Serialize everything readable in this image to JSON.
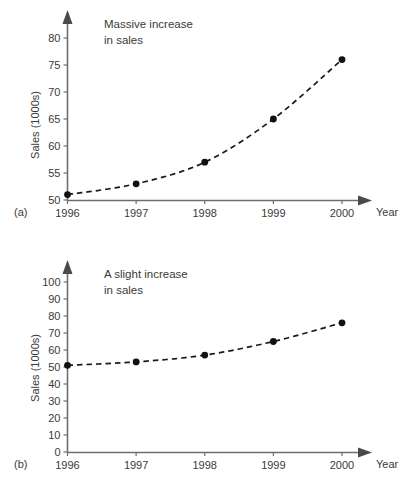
{
  "figure": {
    "panels": [
      {
        "key": "a",
        "label": "(a)",
        "annotation_line1": "Massive increase",
        "annotation_line2": "in sales",
        "ylabel": "Sales (1000s)",
        "xlabel": "Year"
      },
      {
        "key": "b",
        "label": "(b)",
        "annotation_line1": "A slight increase",
        "annotation_line2": "in sales",
        "ylabel": "Sales (1000s)",
        "xlabel": "Year"
      }
    ]
  },
  "colors": {
    "axis": "#6e6e6e",
    "series": "#1a1a1a",
    "marker": "#111111",
    "text": "#3a3a3a",
    "background": "#ffffff"
  },
  "chart_data": [
    {
      "type": "line",
      "panel": "a",
      "title": "Massive increase in sales",
      "xlabel": "Year",
      "ylabel": "Sales (1000s)",
      "categories": [
        "1996",
        "1997",
        "1998",
        "1999",
        "2000"
      ],
      "x": [
        1996,
        1997,
        1998,
        1999,
        2000
      ],
      "values": [
        51,
        53,
        57,
        65,
        76
      ],
      "xlim": [
        1996,
        2000
      ],
      "ylim": [
        50,
        81
      ],
      "yticks": [
        50,
        55,
        60,
        65,
        70,
        75,
        80
      ],
      "xticks": [
        "1996",
        "1997",
        "1998",
        "1999",
        "2000"
      ],
      "grid": false,
      "legend": "none",
      "linestyle": "dashed",
      "marker": "filled-circle",
      "annotations": [
        "Massive increase",
        "in sales"
      ]
    },
    {
      "type": "line",
      "panel": "b",
      "title": "A slight increase in sales",
      "xlabel": "Year",
      "ylabel": "Sales (1000s)",
      "categories": [
        "1996",
        "1997",
        "1998",
        "1999",
        "2000"
      ],
      "x": [
        1996,
        1997,
        1998,
        1999,
        2000
      ],
      "values": [
        51,
        53,
        57,
        65,
        76
      ],
      "xlim": [
        1996,
        2000
      ],
      "ylim": [
        0,
        105
      ],
      "yticks": [
        0,
        10,
        20,
        30,
        40,
        50,
        60,
        70,
        80,
        90,
        100
      ],
      "xticks": [
        "1996",
        "1997",
        "1998",
        "1999",
        "2000"
      ],
      "grid": false,
      "legend": "none",
      "linestyle": "dashed",
      "marker": "filled-circle",
      "annotations": [
        "A slight increase",
        "in sales"
      ]
    }
  ]
}
